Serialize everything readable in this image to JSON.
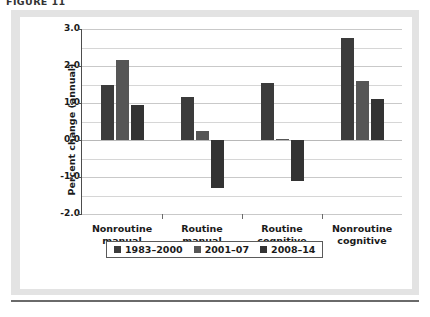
{
  "figure": {
    "caption": "FIGURE 11"
  },
  "chart_data": {
    "type": "bar",
    "title": "",
    "xlabel": "",
    "ylabel": "Percent change (annual)",
    "ylim": [
      -2.0,
      3.0
    ],
    "ytick_labels": [
      "3.0",
      "2.0",
      "1.0",
      "0.0",
      "-1.0",
      "-2.0"
    ],
    "ytick_values": [
      3.0,
      2.0,
      1.0,
      0.0,
      -1.0,
      -2.0
    ],
    "gridlines": [
      3.0,
      2.5,
      2.0,
      1.5,
      1.0,
      0.5,
      0.0,
      -0.5,
      -1.0,
      -1.5,
      -2.0
    ],
    "grid": true,
    "legend_position": "bottom",
    "categories": [
      "Nonroutine\nmanual",
      "Routine\nmanual",
      "Routine\ncognitive",
      "Nonroutine\ncognitive"
    ],
    "category_lines": [
      [
        "Nonroutine",
        "manual"
      ],
      [
        "Routine",
        "manual"
      ],
      [
        "Routine",
        "cognitive"
      ],
      [
        "Nonroutine",
        "cognitive"
      ]
    ],
    "series": [
      {
        "name": "1983–2000",
        "color": "#3b3b3b",
        "values": [
          1.5,
          1.15,
          1.55,
          2.75
        ]
      },
      {
        "name": "2001–07",
        "color": "#565656",
        "values": [
          2.15,
          0.25,
          0.03,
          1.6
        ]
      },
      {
        "name": "2008–14",
        "color": "#333333",
        "values": [
          0.95,
          -1.3,
          -1.1,
          1.1
        ]
      }
    ]
  },
  "legend": {
    "items": [
      {
        "label": "1983–2000",
        "color": "#3b3b3b"
      },
      {
        "label": "2001–07",
        "color": "#565656"
      },
      {
        "label": "2008–14",
        "color": "#333333"
      }
    ]
  }
}
